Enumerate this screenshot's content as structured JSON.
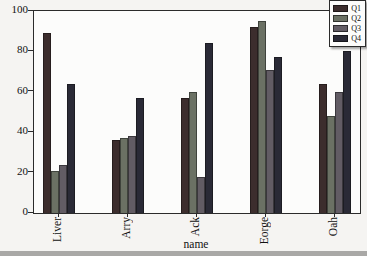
{
  "chart_data": {
    "type": "bar",
    "title": "",
    "xlabel": "name",
    "ylabel": "",
    "categories": [
      "Liver",
      "Arry",
      "Ack",
      "Eorge",
      "Oah"
    ],
    "series": [
      {
        "name": "Q1",
        "color": "#3c2d2d",
        "values": [
          89,
          36,
          57,
          92,
          64
        ]
      },
      {
        "name": "Q2",
        "color": "#6b7164",
        "values": [
          21,
          37,
          60,
          95,
          48
        ]
      },
      {
        "name": "Q3",
        "color": "#625c64",
        "values": [
          24,
          38,
          18,
          71,
          60
        ]
      },
      {
        "name": "Q4",
        "color": "#2a2a36",
        "values": [
          64,
          57,
          84,
          77,
          80
        ]
      }
    ],
    "ylim": [
      0,
      100
    ],
    "yticks": [
      0,
      20,
      40,
      60,
      80,
      100
    ],
    "legend": {
      "position": "upper right",
      "labels": [
        "Q1",
        "Q2",
        "Q3",
        "Q4"
      ]
    },
    "grid": false
  },
  "figure": {
    "background": "#f5f4f2",
    "plot_background": "#fcfcfb",
    "axis_color": "#2b2b2b",
    "text_color": "#111111"
  }
}
